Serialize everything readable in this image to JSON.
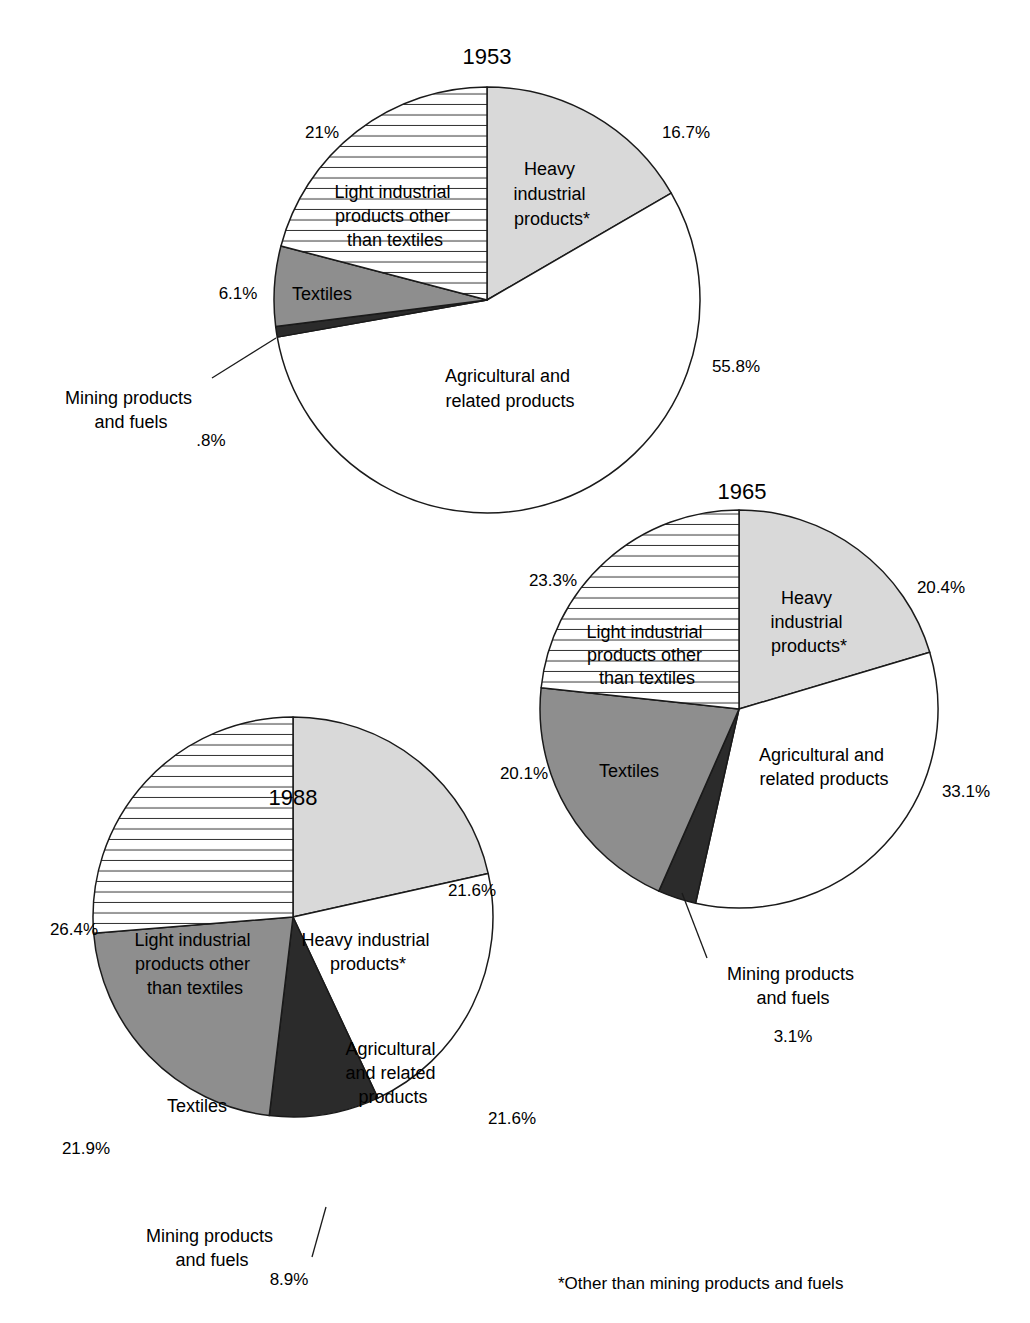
{
  "chart_data": [
    {
      "type": "pie",
      "title": "1953",
      "center": [
        487,
        300
      ],
      "radius": 213,
      "start_angle_deg": 0,
      "direction": "clockwise",
      "slices": [
        {
          "name": "Heavy industrial products*",
          "value": 16.7,
          "label": "16.7%",
          "fill": "heavy"
        },
        {
          "name": "Agricultural and related products",
          "value": 55.8,
          "label": "55.8%",
          "fill": "agri"
        },
        {
          "name": "Mining products and fuels",
          "value": 0.8,
          "label": ".8%",
          "fill": "mining"
        },
        {
          "name": "Textiles",
          "value": 6.1,
          "label": "6.1%",
          "fill": "textiles"
        },
        {
          "name": "Light industrial products other than textiles",
          "value": 21.0,
          "label": "21%",
          "fill": "light"
        }
      ]
    },
    {
      "type": "pie",
      "title": "1965",
      "center": [
        739,
        709
      ],
      "radius": 199,
      "start_angle_deg": 0,
      "direction": "clockwise",
      "slices": [
        {
          "name": "Heavy industrial products*",
          "value": 20.4,
          "label": "20.4%",
          "fill": "heavy"
        },
        {
          "name": "Agricultural and related products",
          "value": 33.1,
          "label": "33.1%",
          "fill": "agri"
        },
        {
          "name": "Mining products and fuels",
          "value": 3.1,
          "label": "3.1%",
          "fill": "mining"
        },
        {
          "name": "Textiles",
          "value": 20.1,
          "label": "20.1%",
          "fill": "textiles"
        },
        {
          "name": "Light industrial products other than textiles",
          "value": 23.3,
          "label": "23.3%",
          "fill": "light"
        }
      ]
    },
    {
      "type": "pie",
      "title": "1988",
      "center": [
        293,
        917
      ],
      "radius": 200,
      "start_angle_deg": 0,
      "direction": "clockwise",
      "slices": [
        {
          "name": "Heavy industrial products*",
          "value": 21.6,
          "label": "21.6%",
          "fill": "heavy"
        },
        {
          "name": "Agricultural and related products",
          "value": 21.6,
          "label": "21.6%",
          "fill": "agri"
        },
        {
          "name": "Mining products and fuels",
          "value": 8.9,
          "label": "8.9%",
          "fill": "mining"
        },
        {
          "name": "Textiles",
          "value": 21.9,
          "label": "21.9%",
          "fill": "textiles"
        },
        {
          "name": "Light industrial products other than textiles",
          "value": 26.4,
          "label": "26.4%",
          "fill": "light"
        }
      ]
    }
  ],
  "fills": {
    "heavy": "#d9d9d9",
    "agri": "#ffffff",
    "mining": "#2b2b2b",
    "textiles": "#8e8e8e",
    "light": "#ffffff",
    "stroke": "#1a1a1a",
    "hatch": "#333333"
  },
  "titles": {
    "t1953": "1953",
    "t1965": "1965",
    "t1988": "1988"
  },
  "labels_1953": {
    "heavy": [
      "Heavy",
      "industrial",
      "products*"
    ],
    "light": [
      "Light industrial",
      "products other",
      "than textiles"
    ],
    "textiles": "Textiles",
    "agri": [
      "Agricultural and",
      "related products"
    ],
    "mining": [
      "Mining products",
      "and fuels"
    ],
    "pct_heavy": "16.7%",
    "pct_light": "21%",
    "pct_textiles": "6.1%",
    "pct_agri": "55.8%",
    "pct_mining": ".8%"
  },
  "labels_1965": {
    "heavy": [
      "Heavy",
      "industrial",
      "products*"
    ],
    "light": [
      "Light industrial",
      "products other",
      "than textiles"
    ],
    "textiles": "Textiles",
    "agri": [
      "Agricultural and",
      "related products"
    ],
    "mining": [
      "Mining products",
      "and fuels"
    ],
    "pct_heavy": "20.4%",
    "pct_light": "23.3%",
    "pct_textiles": "20.1%",
    "pct_agri": "33.1%",
    "pct_mining": "3.1%"
  },
  "labels_1988": {
    "heavy": [
      "Heavy industrial",
      "products*"
    ],
    "light": [
      "Light industrial",
      "products other",
      "than textiles"
    ],
    "textiles": "Textiles",
    "agri": [
      "Agricultural",
      "and related",
      "products"
    ],
    "mining": [
      "Mining products",
      "and fuels"
    ],
    "pct_heavy": "21.6%",
    "pct_light": "26.4%",
    "pct_textiles": "21.9%",
    "pct_agri": "21.6%",
    "pct_mining": "8.9%"
  },
  "footnote": "*Other than mining products and fuels"
}
